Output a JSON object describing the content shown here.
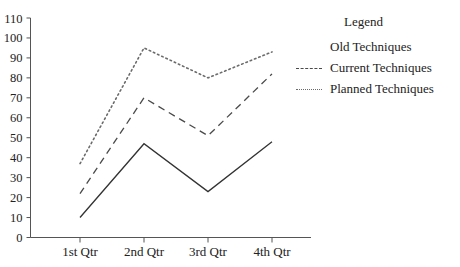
{
  "chart_data": {
    "type": "line",
    "title": "",
    "xlabel": "",
    "ylabel": "",
    "categories": [
      "1st Qtr",
      "2nd Qtr",
      "3rd Qtr",
      "4th Qtr"
    ],
    "ylim": [
      0,
      110
    ],
    "ytick_step": 10,
    "yticks": [
      "110",
      "100",
      "90",
      "80",
      "70",
      "60",
      "50",
      "40",
      "30",
      "20",
      "10",
      "0"
    ],
    "grid": false,
    "legend_position": "right",
    "series": [
      {
        "name": "Old Techniques",
        "style": "solid",
        "color": "#333333",
        "values": [
          10,
          47,
          23,
          48
        ]
      },
      {
        "name": "Current Techniques",
        "style": "dashed",
        "color": "#4a4a4a",
        "values": [
          22,
          70,
          51,
          82
        ]
      },
      {
        "name": "Planned Techniques",
        "style": "dotted",
        "color": "#6b6b6b",
        "values": [
          37,
          95,
          80,
          93
        ]
      }
    ]
  },
  "legend": {
    "title": "Legend",
    "entries": [
      {
        "label": "Old Techniques"
      },
      {
        "label": "Current Techniques"
      },
      {
        "label": "Planned Techniques"
      }
    ]
  },
  "axis": {
    "y_labels": [
      "110",
      "100",
      "90",
      "80",
      "70",
      "60",
      "50",
      "40",
      "30",
      "20",
      "10",
      "0"
    ],
    "x_labels": [
      "1st Qtr",
      "2nd Qtr",
      "3rd Qtr",
      "4th Qtr"
    ]
  }
}
